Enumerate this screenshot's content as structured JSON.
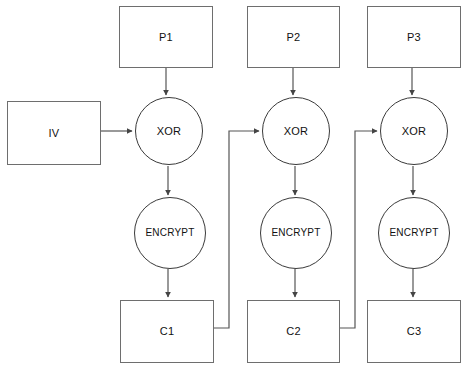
{
  "diagram": {
    "type": "flowchart",
    "canvas": {
      "width": 466,
      "height": 366
    },
    "colors": {
      "background": "#ffffff",
      "box_stroke": "#6e6e6e",
      "circle_stroke": "#3a3a3a",
      "wire_stroke": "#555555",
      "text": "#111111"
    }
  },
  "nodes": {
    "iv": {
      "label": "IV",
      "shape": "rectangle",
      "x": 7,
      "y": 101,
      "w": 94,
      "h": 64
    },
    "plaintext": [
      {
        "label": "P1",
        "shape": "rectangle",
        "x": 119,
        "y": 6,
        "w": 94,
        "h": 62
      },
      {
        "label": "P2",
        "shape": "rectangle",
        "x": 247,
        "y": 6,
        "w": 93,
        "h": 62
      },
      {
        "label": "P3",
        "shape": "rectangle",
        "x": 367,
        "y": 6,
        "w": 94,
        "h": 62
      }
    ],
    "xor": [
      {
        "label": "XOR",
        "shape": "circle",
        "cx": 169,
        "cy": 131,
        "r": 34
      },
      {
        "label": "XOR",
        "shape": "circle",
        "cx": 296,
        "cy": 131,
        "r": 34
      },
      {
        "label": "XOR",
        "shape": "circle",
        "cx": 414,
        "cy": 131,
        "r": 34
      }
    ],
    "encrypt": [
      {
        "label": "ENCRYPT",
        "shape": "circle",
        "cx": 170,
        "cy": 233,
        "r": 36
      },
      {
        "label": "ENCRYPT",
        "shape": "circle",
        "cx": 296,
        "cy": 233,
        "r": 36
      },
      {
        "label": "ENCRYPT",
        "shape": "circle",
        "cx": 414,
        "cy": 233,
        "r": 36
      }
    ],
    "ciphertext": [
      {
        "label": "C1",
        "shape": "rectangle",
        "x": 120,
        "y": 300,
        "w": 94,
        "h": 63
      },
      {
        "label": "C2",
        "shape": "rectangle",
        "x": 247,
        "y": 300,
        "w": 93,
        "h": 63
      },
      {
        "label": "C3",
        "shape": "rectangle",
        "x": 367,
        "y": 300,
        "w": 94,
        "h": 63
      }
    ]
  },
  "connections": [
    {
      "name": "p1-to-xor1",
      "from": "P1",
      "to": "XOR 1",
      "arrow": true
    },
    {
      "name": "p2-to-xor2",
      "from": "P2",
      "to": "XOR 2",
      "arrow": true
    },
    {
      "name": "p3-to-xor3",
      "from": "P3",
      "to": "XOR 3",
      "arrow": true
    },
    {
      "name": "iv-to-xor1",
      "from": "IV",
      "to": "XOR 1",
      "arrow": true
    },
    {
      "name": "xor1-to-encrypt1",
      "from": "XOR 1",
      "to": "ENCRYPT 1",
      "arrow": true
    },
    {
      "name": "xor2-to-encrypt2",
      "from": "XOR 2",
      "to": "ENCRYPT 2",
      "arrow": true
    },
    {
      "name": "xor3-to-encrypt3",
      "from": "XOR 3",
      "to": "ENCRYPT 3",
      "arrow": true
    },
    {
      "name": "encrypt1-to-c1",
      "from": "ENCRYPT 1",
      "to": "C1",
      "arrow": true
    },
    {
      "name": "encrypt2-to-c2",
      "from": "ENCRYPT 2",
      "to": "C2",
      "arrow": true
    },
    {
      "name": "encrypt3-to-c3",
      "from": "ENCRYPT 3",
      "to": "C3",
      "arrow": true
    },
    {
      "name": "c1-feedback-to-xor2",
      "from": "C1",
      "to": "XOR 2",
      "arrow": true
    },
    {
      "name": "c2-feedback-to-xor3",
      "from": "C2",
      "to": "XOR 3",
      "arrow": true
    }
  ]
}
